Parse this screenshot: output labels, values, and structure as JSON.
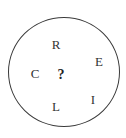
{
  "diagram": {
    "type": "letter-circle-puzzle",
    "shape": "circle",
    "colors": {
      "stroke": "#3a3a3a",
      "text": "#333333",
      "background": "#ffffff"
    },
    "letters": [
      {
        "id": "top",
        "label": "R",
        "x": 56,
        "y": 44
      },
      {
        "id": "upper-right",
        "label": "E",
        "x": 99,
        "y": 61
      },
      {
        "id": "left",
        "label": "C",
        "x": 35,
        "y": 73
      },
      {
        "id": "center",
        "label": "?",
        "x": 61,
        "y": 74
      },
      {
        "id": "lower-right",
        "label": "I",
        "x": 93,
        "y": 99
      },
      {
        "id": "bottom",
        "label": "L",
        "x": 56,
        "y": 106
      }
    ]
  }
}
